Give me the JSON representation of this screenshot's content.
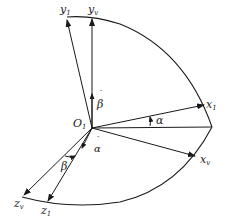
{
  "diagram": {
    "origin": {
      "label": "O",
      "sub": "1",
      "x": 92,
      "y": 128
    },
    "axes": [
      {
        "id": "y1",
        "label": "y",
        "sub": "1",
        "x1": 92,
        "y1": 128,
        "x2": 67,
        "y2": 18
      },
      {
        "id": "yv",
        "label": "y",
        "sub": "v",
        "x1": 92,
        "y1": 128,
        "x2": 92,
        "y2": 17
      },
      {
        "id": "x1",
        "label": "x",
        "sub": "1",
        "x1": 92,
        "y1": 128,
        "x2": 205,
        "y2": 105
      },
      {
        "id": "xv",
        "label": "x",
        "sub": "v",
        "x1": 92,
        "y1": 128,
        "x2": 196,
        "y2": 157
      },
      {
        "id": "zv",
        "label": "z",
        "sub": "v",
        "x1": 92,
        "y1": 128,
        "x2": 22,
        "y2": 197
      },
      {
        "id": "z1",
        "label": "z",
        "sub": "1",
        "x1": 92,
        "y1": 128,
        "x2": 47,
        "y2": 203
      }
    ],
    "angles": [
      {
        "id": "alpha",
        "label": "α"
      },
      {
        "id": "beta",
        "label": "β"
      }
    ],
    "rate_vectors": [
      {
        "id": "beta-dot",
        "label": "β̇"
      },
      {
        "id": "alpha-dot",
        "label": "α̇"
      }
    ],
    "stroke_color": "#1a1a1a",
    "background": "#ffffff"
  }
}
